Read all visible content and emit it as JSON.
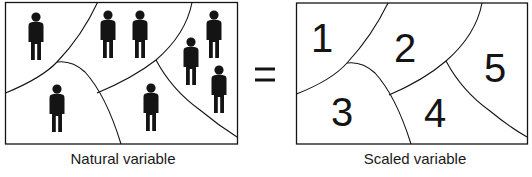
{
  "figure": {
    "equals_sign": "=",
    "left_panel": {
      "caption": "Natural variable",
      "people_count": 9,
      "regions": 5
    },
    "right_panel": {
      "caption": "Scaled variable",
      "region_labels": [
        "1",
        "2",
        "3",
        "4",
        "5"
      ]
    }
  },
  "colors": {
    "ink": "#141414",
    "background": "#ffffff"
  }
}
